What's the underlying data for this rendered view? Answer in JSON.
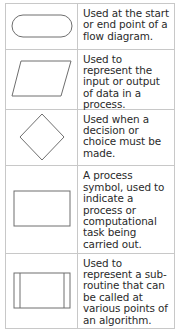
{
  "symbols": [
    {
      "shape": "terminator-rounded-rectangle",
      "description": "Used at the start or end point of a flow diagram."
    },
    {
      "shape": "parallelogram-input-output",
      "description": "Used to represent the input or output of data in a process."
    },
    {
      "shape": "diamond-decision",
      "description": "Used when a decision or choice must be made."
    },
    {
      "shape": "rectangle-process",
      "description": "A process symbol, used to indicate a process or computational task being carried out."
    },
    {
      "shape": "subroutine-rectangle",
      "description": "Used to represent a sub-routine that can be called at various points of an algorithm."
    }
  ],
  "colors": {
    "border": "#c8c8c8",
    "shape_stroke": "#6e6e6e",
    "text": "#2a2a2a"
  }
}
